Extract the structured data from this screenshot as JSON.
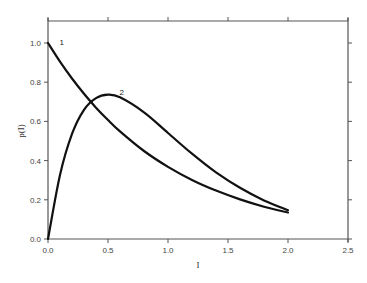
{
  "chart_data": {
    "type": "line",
    "title": "",
    "xlabel": "I",
    "ylabel": "p(I)",
    "xlim": [
      0,
      2.5
    ],
    "ylim": [
      0,
      1.1
    ],
    "xticks": [
      "0.0",
      "0.5",
      "1.0",
      "1.5",
      "2.0",
      "2.5"
    ],
    "yticks": [
      "0.0",
      "0.2",
      "0.4",
      "0.6",
      "0.8",
      "1.0"
    ],
    "grid": false,
    "legend": "none (curves labeled inline '1' and '2')",
    "series": [
      {
        "name": "1",
        "x": [
          0.0,
          0.1,
          0.2,
          0.3,
          0.4,
          0.5,
          0.6,
          0.8,
          1.0,
          1.2,
          1.4,
          1.6,
          1.8,
          2.0
        ],
        "values": [
          1.0,
          0.905,
          0.819,
          0.741,
          0.67,
          0.607,
          0.549,
          0.449,
          0.368,
          0.301,
          0.247,
          0.202,
          0.165,
          0.135
        ]
      },
      {
        "name": "2",
        "x": [
          0.0,
          0.1,
          0.2,
          0.3,
          0.4,
          0.5,
          0.6,
          0.8,
          1.0,
          1.2,
          1.4,
          1.6,
          1.8,
          2.0
        ],
        "values": [
          0.0,
          0.327,
          0.536,
          0.659,
          0.719,
          0.736,
          0.723,
          0.646,
          0.541,
          0.435,
          0.34,
          0.261,
          0.197,
          0.147
        ]
      }
    ],
    "annotations": [
      {
        "text": "1",
        "x": 0.08,
        "y": 1.0
      },
      {
        "text": "2",
        "x": 0.58,
        "y": 0.745
      }
    ]
  }
}
